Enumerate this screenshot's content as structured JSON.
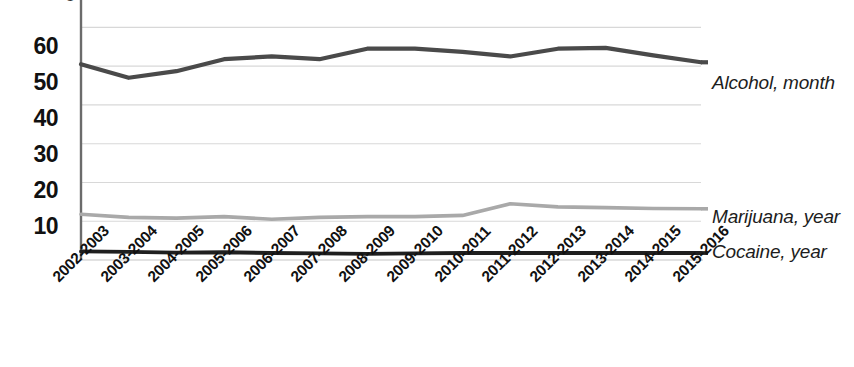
{
  "chart_data": {
    "type": "line",
    "title": "",
    "subtitle": "",
    "xlabel": "",
    "ylabel": "",
    "grid": true,
    "legend_position": "right-inline",
    "ylim": [
      0,
      65
    ],
    "yticks": [
      10,
      20,
      30,
      40,
      50,
      60
    ],
    "categories": [
      "2002-2003",
      "2003-2004",
      "2004-2005",
      "2005-2006",
      "2006-2007",
      "2007-2008",
      "2008-2009",
      "2009-2010",
      "2010-2011",
      "2011-2012",
      "2012-2013",
      "2013-2014",
      "2014-2015",
      "2015-2016"
    ],
    "series": [
      {
        "name": "Alcohol, month",
        "color": "#4a4a4a",
        "width": 4.2,
        "values": [
          50.5,
          47.0,
          48.7,
          51.8,
          52.5,
          51.8,
          54.5,
          54.5,
          53.7,
          52.5,
          54.5,
          54.7,
          52.8,
          51.0
        ]
      },
      {
        "name": "Marijuana, year",
        "color": "#a9a9a9",
        "width": 3.6,
        "values": [
          11.8,
          11.0,
          10.8,
          11.2,
          10.5,
          11.0,
          11.2,
          11.2,
          11.5,
          14.5,
          13.7,
          13.5,
          13.3,
          13.2
        ]
      },
      {
        "name": "Cocaine, year",
        "color": "#1f1f1f",
        "width": 3.8,
        "values": [
          2.2,
          2.1,
          1.9,
          2.0,
          1.8,
          1.7,
          1.6,
          1.7,
          1.8,
          1.8,
          1.8,
          1.8,
          1.8,
          1.8
        ]
      }
    ],
    "annotations": [],
    "axis_color": "#6b6b6b",
    "grid_color": "#d8d8d8",
    "background": "#ffffff"
  },
  "ytick_labels": [
    "60",
    "50",
    "40",
    "30",
    "20",
    "10"
  ],
  "legend_labels": {
    "alcohol": "Alcohol, month",
    "marijuana": "Marijuana, year",
    "cocaine": "Cocaine, year"
  },
  "top_clipped_label": "0"
}
